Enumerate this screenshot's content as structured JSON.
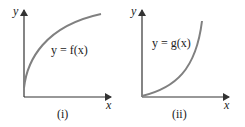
{
  "panels": [
    {
      "caption": "(i)",
      "x_axis_label": "x",
      "y_axis_label": "y",
      "curve_label": "y = f(x)",
      "curve_shape": "concave-down increasing",
      "curve_color": "#808080"
    },
    {
      "caption": "(ii)",
      "x_axis_label": "x",
      "y_axis_label": "y",
      "curve_label": "y = g(x)",
      "curve_shape": "concave-up increasing",
      "curve_color": "#808080"
    }
  ],
  "colors": {
    "axis": "#333333",
    "curve": "#808080",
    "text": "#222222",
    "background": "#ffffff"
  }
}
